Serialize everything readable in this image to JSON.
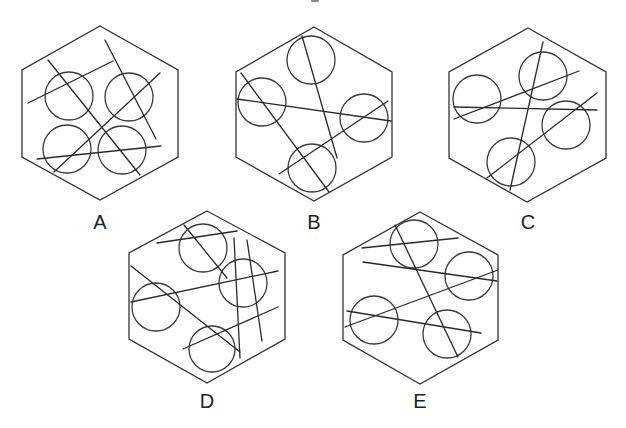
{
  "figure": {
    "colors": {
      "stroke": "#333333",
      "background": "#ffffff",
      "label": "#222222"
    },
    "options": [
      {
        "label": "A",
        "label_pos": [
          100,
          229
        ],
        "hexagon": [
          [
            100,
            26
          ],
          [
            178,
            70
          ],
          [
            178,
            157
          ],
          [
            100,
            200
          ],
          [
            22,
            157
          ],
          [
            22,
            70
          ]
        ],
        "circles": [
          [
            69,
            96,
            24
          ],
          [
            129,
            97,
            24
          ],
          [
            67,
            149,
            24
          ],
          [
            122,
            150,
            24
          ]
        ],
        "lines": [
          [
            28,
            103,
            113,
            61
          ],
          [
            48,
            60,
            140,
            175
          ],
          [
            105,
            40,
            156,
            139
          ],
          [
            160,
            73,
            54,
            172
          ],
          [
            37,
            159,
            161,
            146
          ]
        ]
      },
      {
        "label": "B",
        "label_pos": [
          314,
          229
        ],
        "hexagon": [
          [
            314,
            27
          ],
          [
            392,
            72
          ],
          [
            392,
            157
          ],
          [
            314,
            201
          ],
          [
            236,
            157
          ],
          [
            236,
            72
          ]
        ],
        "circles": [
          [
            311,
            60,
            24
          ],
          [
            262,
            102,
            24
          ],
          [
            364,
            118,
            24
          ],
          [
            312,
            168,
            24
          ]
        ],
        "lines": [
          [
            302,
            36,
            337,
            158
          ],
          [
            241,
            73,
            329,
            192
          ],
          [
            237,
            99,
            391,
            121
          ],
          [
            388,
            101,
            279,
            174
          ]
        ]
      },
      {
        "label": "C",
        "label_pos": [
          528,
          229
        ],
        "hexagon": [
          [
            528,
            28
          ],
          [
            606,
            72
          ],
          [
            606,
            158
          ],
          [
            527,
            202
          ],
          [
            449,
            158
          ],
          [
            449,
            72
          ]
        ],
        "circles": [
          [
            477,
            99,
            24
          ],
          [
            543,
            76,
            24
          ],
          [
            566,
            125,
            24
          ],
          [
            511,
            162,
            24
          ]
        ],
        "lines": [
          [
            543,
            42,
            510,
            190
          ],
          [
            454,
            119,
            579,
            71
          ],
          [
            454,
            107,
            597,
            110
          ],
          [
            597,
            93,
            487,
            178
          ]
        ]
      },
      {
        "label": "D",
        "label_pos": [
          207,
          408
        ],
        "hexagon": [
          [
            207,
            211
          ],
          [
            285,
            253
          ],
          [
            285,
            339
          ],
          [
            207,
            383
          ],
          [
            129,
            339
          ],
          [
            129,
            253
          ]
        ],
        "circles": [
          [
            203,
            248,
            24
          ],
          [
            243,
            283,
            24
          ],
          [
            156,
            307,
            24
          ],
          [
            212,
            349,
            23
          ]
        ],
        "lines": [
          [
            157,
            243,
            237,
            231
          ],
          [
            184,
            225,
            227,
            278
          ],
          [
            234,
            238,
            240,
            358
          ],
          [
            247,
            240,
            262,
            341
          ],
          [
            131,
            302,
            278,
            271
          ],
          [
            131,
            266,
            240,
            352
          ],
          [
            183,
            349,
            278,
            307
          ]
        ]
      },
      {
        "label": "E",
        "label_pos": [
          420,
          408
        ],
        "hexagon": [
          [
            420,
            212
          ],
          [
            498,
            255
          ],
          [
            498,
            340
          ],
          [
            420,
            384
          ],
          [
            343,
            340
          ],
          [
            343,
            255
          ]
        ],
        "circles": [
          [
            414,
            244,
            24
          ],
          [
            469,
            276,
            24
          ],
          [
            374,
            320,
            24
          ],
          [
            447,
            334,
            24
          ]
        ],
        "lines": [
          [
            362,
            248,
            458,
            238
          ],
          [
            395,
            225,
            458,
            357
          ],
          [
            363,
            262,
            497,
            281
          ],
          [
            345,
            327,
            498,
            270
          ],
          [
            347,
            311,
            481,
            333
          ]
        ]
      }
    ]
  }
}
